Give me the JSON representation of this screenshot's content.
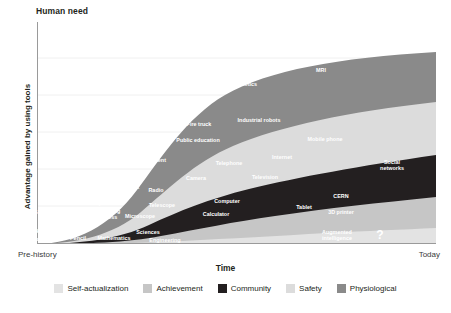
{
  "header": {
    "title": "Human need"
  },
  "axes": {
    "y_label": "Advantage gained by using tools",
    "x_label": "Time",
    "x_tick_left": "Pre-history",
    "x_tick_right": "Today"
  },
  "legend": {
    "items": [
      {
        "label": "Self-actualization",
        "color": "#e3e3e3"
      },
      {
        "label": "Achievement",
        "color": "#c6c6c6"
      },
      {
        "label": "Community",
        "color": "#231f20"
      },
      {
        "label": "Safety",
        "color": "#dcdcdc"
      },
      {
        "label": "Physiological",
        "color": "#8a8a8a"
      }
    ]
  },
  "chart_data": {
    "type": "area",
    "title": "Human need",
    "subtitle": "",
    "xlabel": "Time",
    "ylabel": "Advantage gained by using tools",
    "x_tick_labels": [
      "Pre-history",
      "Today"
    ],
    "xlim": [
      0,
      100
    ],
    "ylim": [
      0,
      100
    ],
    "grid": true,
    "stacked": true,
    "legend_position": "bottom",
    "series": [
      {
        "name": "Self-actualization",
        "color": "#e3e3e3"
      },
      {
        "name": "Achievement",
        "color": "#c6c6c6"
      },
      {
        "name": "Community",
        "color": "#231f20"
      },
      {
        "name": "Safety",
        "color": "#dcdcdc"
      },
      {
        "name": "Physiological",
        "color": "#8a8a8a"
      }
    ],
    "annotations": [
      {
        "text": "Fire",
        "band": "Physiological",
        "x": 5,
        "y": 236.5,
        "tone": "w"
      },
      {
        "text": "Fish hook",
        "band": "Physiological",
        "x": 27,
        "y": 231,
        "tone": "w"
      },
      {
        "text": "Saw",
        "band": "Physiological",
        "x": 39.5,
        "y": 212,
        "tone": "w"
      },
      {
        "text": "Chisel",
        "band": "Physiological",
        "x": 61,
        "y": 211.5,
        "tone": "w"
      },
      {
        "text": "Wheel",
        "band": "Physiological",
        "x": 56,
        "y": 193,
        "tone": "w"
      },
      {
        "text": "Boat",
        "band": "Physiological",
        "x": 71.5,
        "y": 174,
        "tone": "w"
      },
      {
        "text": "Cart",
        "band": "Physiological",
        "x": 86,
        "y": 142,
        "tone": "w"
      },
      {
        "text": "Sanitation",
        "band": "Physiological",
        "x": 121,
        "y": 110,
        "tone": "w"
      },
      {
        "text": "Refrigeration",
        "band": "Physiological",
        "x": 124,
        "y": 101,
        "tone": "w"
      },
      {
        "text": "Auto",
        "band": "Physiological",
        "x": 173,
        "y": 74.5,
        "tone": "w"
      },
      {
        "text": "Plane",
        "band": "Physiological",
        "x": 236,
        "y": 60.5,
        "tone": "w"
      },
      {
        "text": "Antibiotics",
        "band": "Physiological",
        "x": 243,
        "y": 83.5,
        "tone": "w"
      },
      {
        "text": "Rocket",
        "band": "Physiological",
        "x": 284,
        "y": 53.5,
        "tone": "w"
      },
      {
        "text": "MRI",
        "band": "Physiological",
        "x": 321,
        "y": 70,
        "tone": "w"
      },
      {
        "text": "Knife",
        "band": "Safety",
        "x": 50,
        "y": 228,
        "tone": "w"
      },
      {
        "text": "Candle",
        "band": "Safety",
        "x": 81,
        "y": 196,
        "tone": "w"
      },
      {
        "text": "Sword",
        "band": "Safety",
        "x": 92,
        "y": 178,
        "tone": "w"
      },
      {
        "text": "Compass",
        "band": "Safety",
        "x": 110,
        "y": 165,
        "tone": "w"
      },
      {
        "text": "Rifle",
        "band": "Safety",
        "x": 142,
        "y": 148,
        "tone": "w"
      },
      {
        "text": "Government",
        "band": "Safety",
        "x": 150,
        "y": 160,
        "tone": "w"
      },
      {
        "text": "Public education",
        "band": "Safety",
        "x": 198,
        "y": 140,
        "tone": "w"
      },
      {
        "text": "Fire truck",
        "band": "Safety",
        "x": 199,
        "y": 124,
        "tone": "w"
      },
      {
        "text": "Industrial robots",
        "band": "Safety",
        "x": 259,
        "y": 120,
        "tone": "w"
      },
      {
        "text": "Money",
        "band": "Community",
        "x": 93,
        "y": 203,
        "tone": "w"
      },
      {
        "text": "Scale",
        "band": "Community",
        "x": 106,
        "y": 196,
        "tone": "w"
      },
      {
        "text": "Printing\npress",
        "band": "Community",
        "x": 110,
        "y": 214,
        "tone": "w"
      },
      {
        "text": "Clock",
        "band": "Community",
        "x": 132,
        "y": 187,
        "tone": "w"
      },
      {
        "text": "Radio",
        "band": "Community",
        "x": 156,
        "y": 190,
        "tone": "w"
      },
      {
        "text": "Camera",
        "band": "Community",
        "x": 196,
        "y": 178,
        "tone": "w"
      },
      {
        "text": "Telephone",
        "band": "Community",
        "x": 229,
        "y": 163,
        "tone": "w"
      },
      {
        "text": "Television",
        "band": "Community",
        "x": 265,
        "y": 177,
        "tone": "w"
      },
      {
        "text": "Internet",
        "band": "Community",
        "x": 282,
        "y": 157,
        "tone": "w"
      },
      {
        "text": "Mobile phone",
        "band": "Community",
        "x": 325,
        "y": 139,
        "tone": "w"
      },
      {
        "text": "Social\nnetworks",
        "band": "Community",
        "x": 392,
        "y": 165,
        "tone": "w"
      },
      {
        "text": "Abacus",
        "band": "Achievement",
        "x": 77,
        "y": 228,
        "tone": "w"
      },
      {
        "text": "Microscope",
        "band": "Achievement",
        "x": 140,
        "y": 216,
        "tone": "w"
      },
      {
        "text": "Telescope",
        "band": "Achievement",
        "x": 162,
        "y": 205,
        "tone": "w"
      },
      {
        "text": "Calculator",
        "band": "Achievement",
        "x": 216,
        "y": 214,
        "tone": "w"
      },
      {
        "text": "Computer",
        "band": "Achievement",
        "x": 227,
        "y": 201,
        "tone": "w"
      },
      {
        "text": "Tablet",
        "band": "Achievement",
        "x": 304,
        "y": 207,
        "tone": "w"
      },
      {
        "text": "CERN",
        "band": "Achievement",
        "x": 341,
        "y": 196,
        "tone": "w"
      },
      {
        "text": "3D printer",
        "band": "Achievement",
        "x": 341,
        "y": 212,
        "tone": "w"
      },
      {
        "text": "Language",
        "band": "Self-actualization",
        "x": 46,
        "y": 239,
        "tone": "w"
      },
      {
        "text": "Pencil",
        "band": "Self-actualization",
        "x": 78,
        "y": 238,
        "tone": "w"
      },
      {
        "text": "Mathematics",
        "band": "Self-actualization",
        "x": 114,
        "y": 238,
        "tone": "w"
      },
      {
        "text": "Sciences",
        "band": "Self-actualization",
        "x": 148,
        "y": 232,
        "tone": "w"
      },
      {
        "text": "Engineering",
        "band": "Self-actualization",
        "x": 165,
        "y": 240,
        "tone": "w"
      },
      {
        "text": "Augmented\nintelligence",
        "band": "Self-actualization",
        "x": 337,
        "y": 235,
        "tone": "w"
      },
      {
        "text": "?",
        "band": "Self-actualization",
        "x": 380,
        "y": 235,
        "tone": "w",
        "big": true
      }
    ]
  }
}
